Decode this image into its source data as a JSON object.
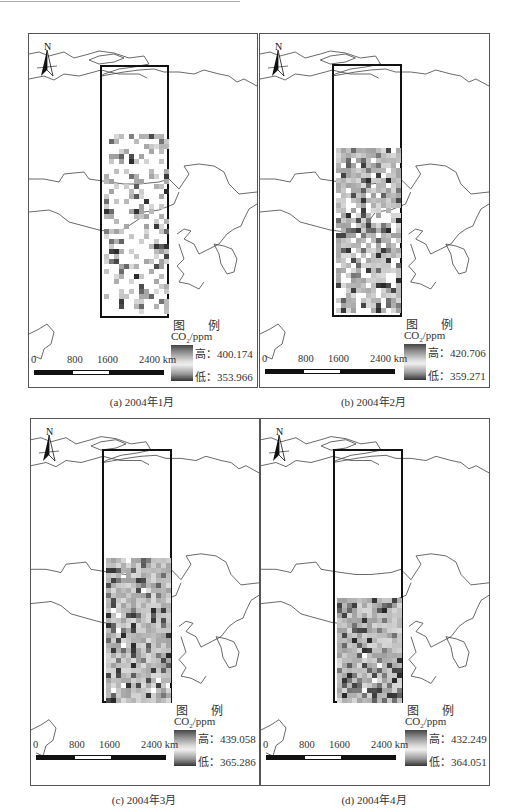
{
  "figure": {
    "panels": [
      {
        "id": "a",
        "caption": "(a) 2004年1月",
        "legend": {
          "title": "图 例",
          "unit_prefix": "CO",
          "unit_sub": "2",
          "unit_suffix": "/ppm",
          "high_label": "高：400.174",
          "low_label": "低：353.966",
          "high": 400.174,
          "low": 353.966
        },
        "scale": {
          "ticks": [
            "0",
            "800",
            "1600",
            "2400 km"
          ]
        }
      },
      {
        "id": "b",
        "caption": "(b) 2004年2月",
        "legend": {
          "title": "图 例",
          "unit_prefix": "CO",
          "unit_sub": "2",
          "unit_suffix": "/ppm",
          "high_label": "高：420.706",
          "low_label": "低：359.271",
          "high": 420.706,
          "low": 359.271
        },
        "scale": {
          "ticks": [
            "0",
            "800",
            "1600",
            "2400 km"
          ]
        }
      },
      {
        "id": "c",
        "caption": "(c) 2004年3月",
        "legend": {
          "title": "图 例",
          "unit_prefix": "CO",
          "unit_sub": "2",
          "unit_suffix": "/ppm",
          "high_label": "高：439.058",
          "low_label": "低：365.286",
          "high": 439.058,
          "low": 365.286
        },
        "scale": {
          "ticks": [
            "0",
            "800",
            "1600",
            "2400 km"
          ]
        }
      },
      {
        "id": "d",
        "caption": "(d) 2004年4月",
        "legend": {
          "title": "图 例",
          "unit_prefix": "CO",
          "unit_sub": "2",
          "unit_suffix": "/ppm",
          "high_label": "高：432.249",
          "low_label": "低：364.051",
          "high": 432.249,
          "low": 364.051
        },
        "scale": {
          "ticks": [
            "0",
            "800",
            "1600",
            "2400 km"
          ]
        }
      }
    ],
    "north_arrow_label": "N",
    "colors": {
      "frame": "#555555",
      "study_rect": "#111111",
      "outline": "#444444",
      "ramp_dark": "#333333",
      "ramp_light": "#eeeeee"
    }
  }
}
